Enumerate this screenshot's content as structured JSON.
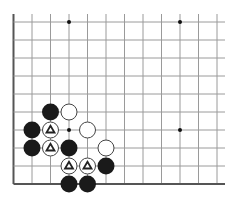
{
  "board": {
    "origin_x": 13.5,
    "origin_y": 22,
    "spacing_x": 18.5,
    "spacing_y": 18.0,
    "cols": 12,
    "rows": 10,
    "right_extent": 225,
    "top_extent": 14,
    "edges": {
      "left": true,
      "bottom": true,
      "top": false,
      "right": false
    },
    "line_color": "#9a9a9a",
    "edge_color": "#555555",
    "stone_radius": 8.5,
    "colors": {
      "black": "#1a1a1a",
      "white": "#ffffff",
      "white_stroke": "#444444",
      "marker": "#222222"
    }
  },
  "star_points": [
    {
      "col": 3,
      "row": 0
    },
    {
      "col": 9,
      "row": 0
    },
    {
      "col": 3,
      "row": 6
    },
    {
      "col": 9,
      "row": 6
    }
  ],
  "stones": [
    {
      "color": "black",
      "col": 2,
      "row": 5,
      "marker": ""
    },
    {
      "color": "white",
      "col": 3,
      "row": 5,
      "marker": ""
    },
    {
      "color": "black",
      "col": 1,
      "row": 6,
      "marker": ""
    },
    {
      "color": "white",
      "col": 2,
      "row": 6,
      "marker": "triangle"
    },
    {
      "color": "white",
      "col": 4,
      "row": 6,
      "marker": ""
    },
    {
      "color": "black",
      "col": 1,
      "row": 7,
      "marker": ""
    },
    {
      "color": "white",
      "col": 2,
      "row": 7,
      "marker": "triangle"
    },
    {
      "color": "black",
      "col": 3,
      "row": 7,
      "marker": ""
    },
    {
      "color": "white",
      "col": 5,
      "row": 7,
      "marker": ""
    },
    {
      "color": "white",
      "col": 3,
      "row": 8,
      "marker": "triangle"
    },
    {
      "color": "white",
      "col": 4,
      "row": 8,
      "marker": "triangle"
    },
    {
      "color": "black",
      "col": 5,
      "row": 8,
      "marker": ""
    },
    {
      "color": "black",
      "col": 3,
      "row": 9,
      "marker": ""
    },
    {
      "color": "black",
      "col": 4,
      "row": 9,
      "marker": ""
    }
  ]
}
